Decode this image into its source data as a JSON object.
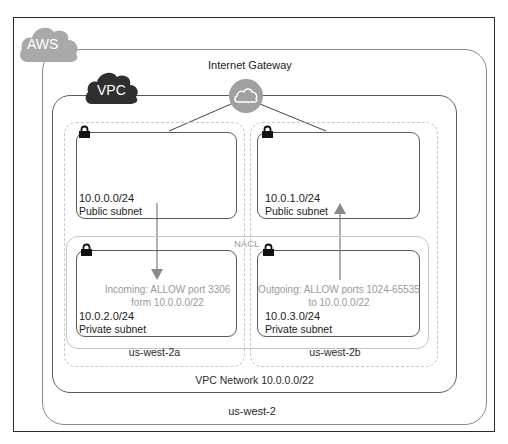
{
  "diagram": {
    "region_badge": "AWS",
    "vpc_badge": "VPC",
    "internet_gateway": {
      "label": "Internet Gateway",
      "icon": "cloud-icon"
    },
    "nacl_label": "NACL",
    "vpc_network_label": "VPC Network 10.0.0.0/22",
    "region_label": "us-west-2",
    "availability_zones": [
      {
        "name": "us-west-2a",
        "public_subnet": {
          "cidr": "10.0.0.0/24",
          "label": "Public subnet"
        },
        "private_subnet": {
          "cidr": "10.0.2.0/24",
          "label": "Private subnet"
        },
        "rule": {
          "line1": "Incoming: ALLOW port 3306",
          "line2": "form 10.0.0.0/22",
          "direction": "down"
        }
      },
      {
        "name": "us-west-2b",
        "public_subnet": {
          "cidr": "10.0.1.0/24",
          "label": "Public subnet"
        },
        "private_subnet": {
          "cidr": "10.0.3.0/24",
          "label": "Private subnet"
        },
        "rule": {
          "line1": "Outgoing: ALLOW ports 1024-65535",
          "line2": "to 10.0.0.0/22",
          "direction": "up"
        }
      }
    ],
    "colors": {
      "aws_cloud": "#a9a9a9",
      "vpc_cloud": "#2f2f2f",
      "gateway_circle": "#a0a0a0",
      "arrow": "#8a8a8a",
      "rule_text": "#9a9a9a",
      "frame": "#2a2a2a"
    }
  }
}
